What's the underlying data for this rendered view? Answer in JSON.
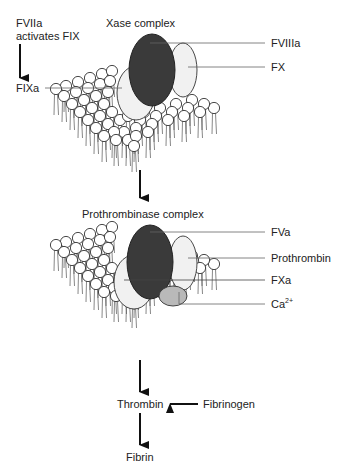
{
  "diagram": {
    "type": "biochemical-pathway",
    "top_note": {
      "line1": "FVIIa",
      "line2": "activates FIX"
    },
    "xase": {
      "title": "Xase complex",
      "labels": {
        "fviiia": "FVIIIa",
        "fx": "FX",
        "fixa": "FIXa"
      }
    },
    "prothrombinase": {
      "title": "Prothrombinase complex",
      "labels": {
        "fva": "FVa",
        "prothrombin": "Prothrombin",
        "fxa": "FXa",
        "ca": "Ca",
        "ca_sup": "2+"
      }
    },
    "cascade": {
      "thrombin": "Thrombin",
      "fibrinogen": "Fibrinogen",
      "fibrin": "Fibrin"
    },
    "colors": {
      "dark_protein": "#3a3a3a",
      "light_protein": "#f1f1f1",
      "calcium": "#b9b9b9",
      "line": "#222222"
    }
  }
}
